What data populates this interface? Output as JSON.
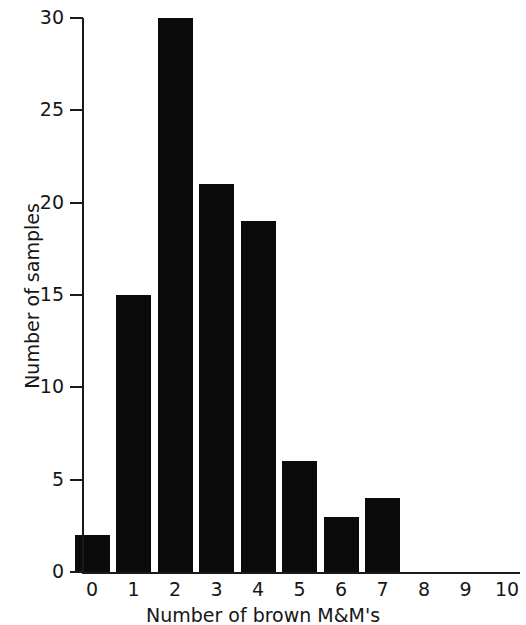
{
  "chart_data": {
    "type": "bar",
    "title": "",
    "subtitle": "",
    "xlabel": "Number of brown M&M's",
    "ylabel": "Number of samples",
    "categories": [
      "0",
      "1",
      "2",
      "3",
      "4",
      "5",
      "6",
      "7",
      "8",
      "9",
      "10"
    ],
    "values": [
      2,
      15,
      30,
      21,
      19,
      6,
      3,
      4,
      0,
      0,
      0
    ],
    "series": [
      {
        "name": "Number of samples",
        "values": [
          2,
          15,
          30,
          21,
          19,
          6,
          3,
          4,
          0,
          0,
          0
        ]
      }
    ],
    "xlim": [
      -0.5,
      10.5
    ],
    "ylim": [
      0,
      30
    ],
    "y_ticks": [
      0,
      5,
      10,
      15,
      20,
      25,
      30
    ],
    "y_tick_labels": [
      "0",
      "5",
      "10",
      "15",
      "20",
      "25",
      "30"
    ],
    "x_ticks": [
      0,
      1,
      2,
      3,
      4,
      5,
      6,
      7,
      8,
      9,
      10
    ],
    "x_tick_labels": [
      "0",
      "1",
      "2",
      "3",
      "4",
      "5",
      "6",
      "7",
      "8",
      "9",
      "10"
    ],
    "grid": false,
    "legend": false,
    "legend_position": "none",
    "bar_color": "#0b0b0b",
    "axis_color": "#1a1a1a",
    "background_color": "#ffffff",
    "annotations": []
  }
}
